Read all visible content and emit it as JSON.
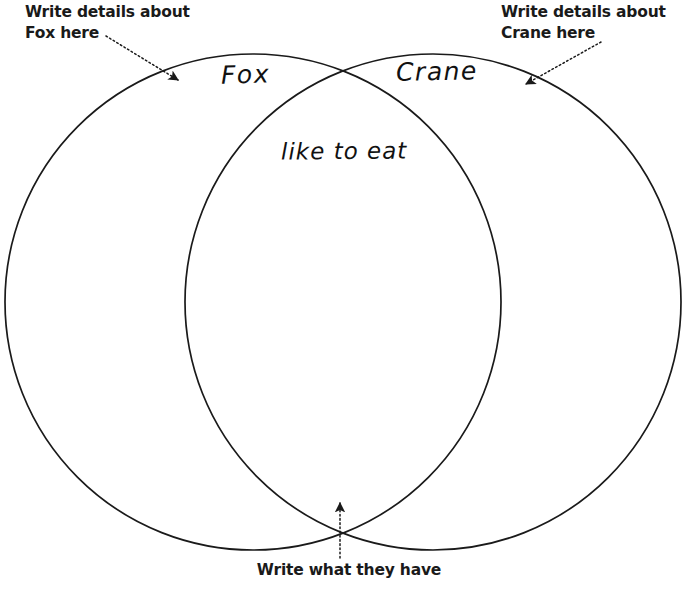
{
  "page": {
    "background_color": "#ffffff",
    "ink_color": "#1a1a1a",
    "width": 692,
    "height": 591
  },
  "diagram": {
    "type": "venn-two-circle",
    "left_circle": {
      "name": "Fox",
      "label": "Fox",
      "cx": 253,
      "cy": 302,
      "r": 248
    },
    "right_circle": {
      "name": "Crane",
      "label": "Crane",
      "cx": 433,
      "cy": 302,
      "r": 248
    },
    "intersection": {
      "label": "like to eat"
    }
  },
  "annotations": {
    "left": {
      "text": "Write details about\nFox here",
      "arrow_name": "arrow-to-fox-region"
    },
    "right": {
      "text": "Write details about\nCrane here",
      "arrow_name": "arrow-to-crane-region"
    },
    "bottom": {
      "text": "Write what they have",
      "arrow_name": "arrow-to-shared-region"
    }
  }
}
